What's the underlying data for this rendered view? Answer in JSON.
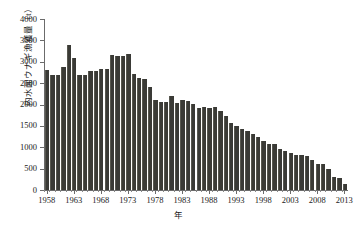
{
  "chart_data": {
    "type": "bar",
    "title": "",
    "xlabel": "年",
    "ylabel": "内水面ウナギ漁獲量（t）",
    "ylim": [
      0,
      4000
    ],
    "ytick_labels": [
      "0",
      "500",
      "1000",
      "1500",
      "2000",
      "2500",
      "3000",
      "3500",
      "4000"
    ],
    "ytick_values": [
      0,
      500,
      1000,
      1500,
      2000,
      2500,
      3000,
      3500,
      4000
    ],
    "xtick_labels": [
      "1958",
      "1963",
      "1968",
      "1973",
      "1978",
      "1983",
      "1988",
      "1993",
      "1998",
      "2003",
      "2008",
      "2013"
    ],
    "xtick_values": [
      1958,
      1963,
      1968,
      1973,
      1978,
      1983,
      1988,
      1993,
      1998,
      2003,
      2008,
      2013
    ],
    "xlim": [
      1957.5,
      2013.5
    ],
    "grid": false,
    "legend": null,
    "bar_color": "#3a3a36",
    "axis_color": "#6b6b6b",
    "background": "#ffffff",
    "categories": [
      1958,
      1959,
      1960,
      1961,
      1962,
      1963,
      1964,
      1965,
      1966,
      1967,
      1968,
      1969,
      1970,
      1971,
      1972,
      1973,
      1974,
      1975,
      1976,
      1977,
      1978,
      1979,
      1980,
      1981,
      1982,
      1983,
      1984,
      1985,
      1986,
      1987,
      1988,
      1989,
      1990,
      1991,
      1992,
      1993,
      1994,
      1995,
      1996,
      1997,
      1998,
      1999,
      2000,
      2001,
      2002,
      2003,
      2004,
      2005,
      2006,
      2007,
      2008,
      2009,
      2010,
      2011,
      2012,
      2013
    ],
    "values": [
      2800,
      2680,
      2680,
      2870,
      3390,
      3080,
      2700,
      2700,
      2780,
      2790,
      2820,
      2830,
      3160,
      3130,
      3140,
      3190,
      2710,
      2620,
      2590,
      2420,
      2100,
      2060,
      2070,
      2210,
      2030,
      2100,
      2090,
      2020,
      1930,
      1940,
      1930,
      1940,
      1840,
      1720,
      1570,
      1500,
      1430,
      1370,
      1320,
      1230,
      1150,
      1080,
      1070,
      970,
      920,
      860,
      820,
      810,
      790,
      700,
      610,
      600,
      480,
      310,
      290,
      150
    ],
    "series": [
      {
        "name": "内水面ウナギ漁獲量",
        "values": [
          2800,
          2680,
          2680,
          2870,
          3390,
          3080,
          2700,
          2700,
          2780,
          2790,
          2820,
          2830,
          3160,
          3130,
          3140,
          3190,
          2710,
          2620,
          2590,
          2420,
          2100,
          2060,
          2070,
          2210,
          2030,
          2100,
          2090,
          2020,
          1930,
          1940,
          1930,
          1940,
          1840,
          1720,
          1570,
          1500,
          1430,
          1370,
          1320,
          1230,
          1150,
          1080,
          1070,
          970,
          920,
          860,
          820,
          810,
          790,
          700,
          610,
          600,
          480,
          310,
          290,
          150
        ]
      }
    ]
  }
}
